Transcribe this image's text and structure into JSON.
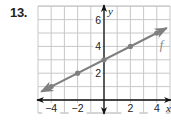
{
  "problem": {
    "number": "13."
  },
  "chart_data": {
    "type": "line",
    "title": "",
    "xlabel": "x",
    "ylabel": "y",
    "xlim": [
      -5,
      5
    ],
    "ylim": [
      -1,
      7
    ],
    "grid": true,
    "x_ticks": [
      -4,
      -2,
      2,
      4
    ],
    "x_tick_labels": [
      "−4",
      "−2",
      "2",
      "4"
    ],
    "y_ticks": [
      2,
      4,
      6
    ],
    "y_tick_labels": [
      "2",
      "4",
      "6"
    ],
    "series": [
      {
        "name": "f",
        "color": "#7f7f7f",
        "x": [
          -4,
          -2,
          0,
          2,
          4
        ],
        "y": [
          1,
          2,
          3,
          4,
          5
        ],
        "equation": "f(x) = 0.5x + 3",
        "arrows": "both"
      }
    ],
    "legend": {
      "label": "f",
      "position": "near line, upper right"
    }
  },
  "colors": {
    "axis": "#111111",
    "grid": "#c8c8c8",
    "line": "#7f7f7f"
  }
}
